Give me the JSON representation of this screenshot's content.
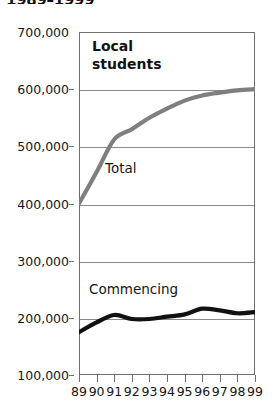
{
  "title": "1989–1999",
  "chart_data": {
    "type": "line",
    "title": "1989–1999",
    "subtitle": "Local students",
    "xlabel": "",
    "ylabel": "",
    "categories": [
      "89",
      "90",
      "91",
      "92",
      "93",
      "94",
      "95",
      "96",
      "97",
      "98",
      "99"
    ],
    "x_tick_labels": [
      "89",
      "90",
      "91",
      "92",
      "93",
      "94",
      "95",
      "96",
      "97",
      "98",
      "99"
    ],
    "y_tick_labels": [
      "100,000",
      "200,000",
      "300,000",
      "400,000",
      "500,000",
      "600,000",
      "700,000"
    ],
    "y_tick_values": [
      100000,
      200000,
      300000,
      400000,
      500000,
      600000,
      700000
    ],
    "ylim": [
      100000,
      700000
    ],
    "grid": true,
    "legend_position": "inline-annotation",
    "annotations": [
      {
        "text": "Local students",
        "kind": "panel-heading"
      },
      {
        "text": "Total",
        "kind": "series-label"
      },
      {
        "text": "Commencing",
        "kind": "series-label"
      }
    ],
    "series": [
      {
        "name": "Total",
        "color": "#7f7f7f",
        "values": [
          400000,
          455000,
          512000,
          530000,
          550000,
          566000,
          580000,
          589000,
          594000,
          598000,
          600000
        ]
      },
      {
        "name": "Commencing",
        "color": "#111111",
        "values": [
          175000,
          192000,
          205000,
          198000,
          198000,
          202000,
          206000,
          216000,
          213000,
          208000,
          210000
        ]
      }
    ]
  }
}
